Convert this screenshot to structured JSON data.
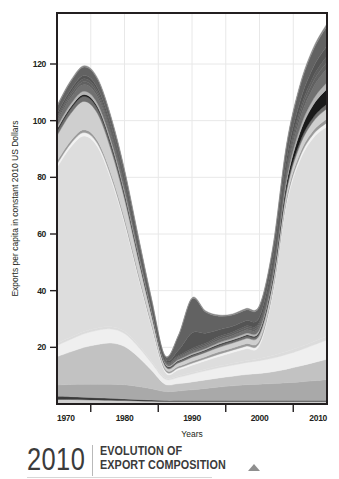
{
  "figure": {
    "caption": {
      "year": "2010",
      "title_line1": "EVOLUTION OF",
      "title_line2": "EXPORT COMPOSITION",
      "marker_icon": "triangle-up-icon"
    }
  },
  "chart_data": {
    "type": "area",
    "stacked": true,
    "title": "",
    "xlabel": "Years",
    "ylabel": "Exports per capita in constant 2010 US Dollars",
    "xlim": [
      1970,
      2010
    ],
    "ylim": [
      0,
      138
    ],
    "xticks": [
      1970,
      1980,
      1990,
      2000,
      2010
    ],
    "xtick_labels": [
      "1970",
      "1980",
      "1990",
      "2000",
      "2010"
    ],
    "xminor_ticks": [
      1975,
      1985,
      1995,
      2005
    ],
    "yticks": [
      20,
      40,
      60,
      80,
      100,
      120
    ],
    "ytick_labels": [
      "20",
      "40",
      "60",
      "80",
      "100",
      "120"
    ],
    "grid": true,
    "grid_color": "#e8e8e8",
    "frame_color": "#231f20",
    "plot_background": "#ffffff",
    "legend": "none",
    "x": [
      1970,
      1972,
      1974,
      1976,
      1978,
      1980,
      1982,
      1984,
      1986,
      1988,
      1990,
      1992,
      1994,
      1996,
      1998,
      2000,
      2002,
      2004,
      2006,
      2008,
      2010
    ],
    "series": [
      {
        "name": "layer-1",
        "color": "#d0d0d0",
        "values": [
          1.6,
          1.6,
          1.5,
          1.4,
          1.3,
          1.2,
          1.1,
          1.0,
          0.9,
          0.9,
          0.9,
          0.9,
          0.9,
          0.9,
          0.9,
          0.9,
          0.9,
          0.9,
          0.9,
          0.9,
          0.9
        ]
      },
      {
        "name": "layer-2",
        "color": "#3a3a3a",
        "values": [
          1.1,
          1.0,
          0.9,
          0.8,
          0.7,
          0.6,
          0.5,
          0.4,
          0.3,
          0.3,
          0.3,
          0.3,
          0.3,
          0.3,
          0.3,
          0.3,
          0.3,
          0.3,
          0.3,
          0.3,
          0.3
        ]
      },
      {
        "name": "layer-3",
        "color": "#a9a9a9",
        "values": [
          4.0,
          4.3,
          4.6,
          4.8,
          5.0,
          5.0,
          4.6,
          4.0,
          3.2,
          3.4,
          3.8,
          4.3,
          4.8,
          5.2,
          5.6,
          5.8,
          6.0,
          6.3,
          6.6,
          7.0,
          7.4
        ]
      },
      {
        "name": "layer-4",
        "color": "#c2c2c2",
        "values": [
          10.0,
          11.5,
          13.0,
          14.0,
          14.5,
          13.5,
          10.5,
          6.5,
          2.6,
          2.6,
          2.8,
          3.0,
          3.2,
          3.4,
          3.6,
          3.8,
          4.2,
          4.8,
          5.6,
          6.4,
          7.2
        ]
      },
      {
        "name": "layer-5",
        "color": "#efefef",
        "values": [
          4.0,
          4.4,
          4.8,
          5.0,
          5.0,
          4.6,
          3.6,
          2.6,
          1.8,
          2.2,
          2.8,
          3.2,
          3.6,
          3.9,
          4.2,
          4.5,
          4.8,
          5.2,
          5.6,
          6.2,
          6.8
        ]
      },
      {
        "name": "layer-6",
        "color": "#dcdcdc",
        "values": [
          0.8,
          0.8,
          0.8,
          0.8,
          0.8,
          0.8,
          0.7,
          0.6,
          0.5,
          0.5,
          0.5,
          0.6,
          0.6,
          0.7,
          0.7,
          0.8,
          0.9,
          1.0,
          1.1,
          1.2,
          1.3
        ]
      },
      {
        "name": "layer-7",
        "color": "#dddddd",
        "values": [
          62.0,
          67.0,
          69.0,
          64.0,
          52.0,
          38.0,
          24.0,
          12.0,
          2.0,
          2.2,
          2.6,
          3.0,
          3.4,
          3.8,
          4.2,
          4.6,
          22.0,
          52.0,
          66.0,
          72.0,
          74.0
        ]
      },
      {
        "name": "layer-8",
        "color": "#f2f2f2",
        "values": [
          1.2,
          1.2,
          1.2,
          1.1,
          1.0,
          0.9,
          0.8,
          0.7,
          0.6,
          0.6,
          0.7,
          0.7,
          0.8,
          0.8,
          0.9,
          0.9,
          1.0,
          1.1,
          1.2,
          1.3,
          1.4
        ]
      },
      {
        "name": "layer-9",
        "color": "#9a9a9a",
        "values": [
          1.0,
          1.0,
          1.0,
          1.0,
          1.0,
          1.0,
          0.9,
          0.8,
          0.6,
          0.6,
          0.7,
          0.7,
          0.8,
          0.8,
          0.9,
          0.9,
          1.0,
          1.1,
          1.2,
          1.3,
          1.4
        ]
      },
      {
        "name": "layer-10",
        "color": "#cfcfcf",
        "values": [
          9.0,
          9.6,
          10.0,
          9.6,
          8.4,
          6.8,
          4.8,
          2.8,
          1.0,
          1.2,
          1.4,
          1.5,
          1.6,
          1.7,
          1.8,
          1.9,
          2.1,
          2.4,
          2.8,
          3.2,
          3.6
        ]
      },
      {
        "name": "layer-11",
        "color": "#6e6e6e",
        "values": [
          1.6,
          1.7,
          1.8,
          1.8,
          1.7,
          1.5,
          1.2,
          0.9,
          0.5,
          0.6,
          0.7,
          0.7,
          0.8,
          0.8,
          0.9,
          0.9,
          1.0,
          1.1,
          1.3,
          1.5,
          1.7
        ]
      },
      {
        "name": "layer-12",
        "color": "#1a1a1a",
        "values": [
          0.6,
          0.6,
          0.6,
          0.6,
          0.6,
          0.5,
          0.4,
          0.3,
          0.2,
          0.2,
          0.2,
          0.2,
          0.3,
          0.3,
          0.3,
          0.4,
          0.8,
          1.8,
          3.2,
          4.4,
          5.2
        ]
      },
      {
        "name": "layer-13",
        "color": "#b5b5b5",
        "values": [
          1.0,
          1.1,
          1.2,
          1.2,
          1.1,
          1.0,
          0.8,
          0.6,
          0.4,
          0.4,
          0.5,
          0.5,
          0.6,
          0.6,
          0.7,
          0.7,
          0.9,
          1.2,
          1.6,
          2.0,
          2.4
        ]
      },
      {
        "name": "layer-14",
        "color": "#707070",
        "values": [
          2.0,
          2.2,
          2.4,
          2.4,
          2.2,
          1.9,
          1.5,
          1.0,
          0.5,
          0.6,
          0.7,
          0.8,
          0.9,
          1.0,
          1.1,
          1.2,
          1.6,
          2.4,
          3.4,
          4.2,
          4.8
        ]
      },
      {
        "name": "layer-15",
        "color": "#616161",
        "values": [
          0.8,
          0.9,
          1.0,
          1.0,
          0.9,
          0.8,
          0.6,
          0.4,
          0.3,
          0.4,
          0.5,
          0.5,
          0.6,
          0.6,
          0.7,
          0.7,
          0.9,
          1.2,
          1.6,
          2.0,
          2.3
        ]
      },
      {
        "name": "layer-16",
        "color": "#5e5e5e",
        "values": [
          0.8,
          0.9,
          1.0,
          1.0,
          1.0,
          0.9,
          0.7,
          0.5,
          0.3,
          0.4,
          0.5,
          0.5,
          0.6,
          0.6,
          0.7,
          0.7,
          0.9,
          1.2,
          1.5,
          1.8,
          2.1
        ]
      },
      {
        "name": "layer-17",
        "color": "#545454",
        "values": [
          0.9,
          1.0,
          1.1,
          1.1,
          1.0,
          0.9,
          0.7,
          0.5,
          0.4,
          2.0,
          5.5,
          3.6,
          2.4,
          2.0,
          1.9,
          1.8,
          2.0,
          2.4,
          2.8,
          3.2,
          3.6
        ]
      },
      {
        "name": "layer-18",
        "color": "#626262",
        "values": [
          2.5,
          2.8,
          3.0,
          3.0,
          2.8,
          2.4,
          1.9,
          1.3,
          0.8,
          5.0,
          12.0,
          7.5,
          4.8,
          4.0,
          3.8,
          3.6,
          4.0,
          4.6,
          5.4,
          6.2,
          7.0
        ]
      },
      {
        "name": "layer-19",
        "color": "#888888",
        "values": [
          0.5,
          0.5,
          0.5,
          0.5,
          0.5,
          0.5,
          0.4,
          0.3,
          0.2,
          0.3,
          0.4,
          0.4,
          0.4,
          0.4,
          0.5,
          0.5,
          0.5,
          0.6,
          0.7,
          0.8,
          0.9
        ]
      }
    ]
  }
}
